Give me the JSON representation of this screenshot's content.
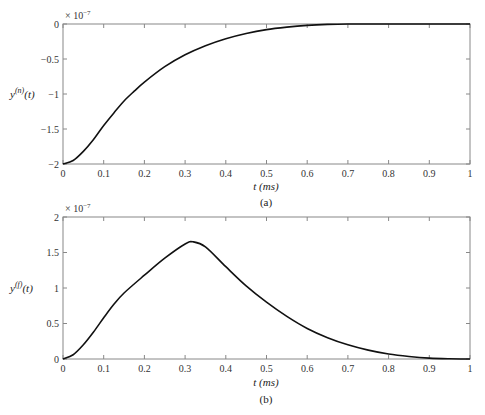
{
  "chart_data": [
    {
      "panel": "(a)",
      "type": "line",
      "title": "",
      "caption": "(a)",
      "xlabel": "t (ms)",
      "ylabel": "y(n)(t)",
      "ylabel_base": "y",
      "ylabel_sup": "(n)",
      "ylabel_arg": "(t)",
      "scale_label": "× 10",
      "scale_exp": "−7",
      "xlim": [
        0,
        1
      ],
      "ylim": [
        -2,
        0
      ],
      "xticks": [
        0,
        0.1,
        0.2,
        0.3,
        0.4,
        0.5,
        0.6,
        0.7,
        0.8,
        0.9,
        1
      ],
      "xtick_labels": [
        "0",
        "0.1",
        "0.2",
        "0.3",
        "0.4",
        "0.5",
        "0.6",
        "0.7",
        "0.8",
        "0.9",
        "1"
      ],
      "yticks": [
        -2,
        -1.5,
        -1,
        -0.5,
        0
      ],
      "ytick_labels": [
        "−2",
        "−1.5",
        "−1",
        "−0.5",
        "0"
      ],
      "grid": false,
      "x": [
        0,
        0.025,
        0.05,
        0.075,
        0.1,
        0.125,
        0.15,
        0.175,
        0.2,
        0.25,
        0.3,
        0.35,
        0.4,
        0.45,
        0.5,
        0.55,
        0.6,
        0.65,
        0.7,
        0.8,
        0.9,
        1.0
      ],
      "series": [
        {
          "name": "y(n)(t)",
          "color": "#111111",
          "values": [
            -2.0,
            -1.95,
            -1.82,
            -1.65,
            -1.45,
            -1.27,
            -1.1,
            -0.96,
            -0.83,
            -0.61,
            -0.44,
            -0.31,
            -0.21,
            -0.135,
            -0.08,
            -0.045,
            -0.02,
            -0.006,
            0.0,
            0.0,
            0.0,
            0.0
          ]
        }
      ]
    },
    {
      "panel": "(b)",
      "type": "line",
      "title": "",
      "caption": "(b)",
      "xlabel": "t (ms)",
      "ylabel": "y(f)(t)",
      "ylabel_base": "y",
      "ylabel_sup": "(f)",
      "ylabel_arg": "(t)",
      "scale_label": "× 10",
      "scale_exp": "−7",
      "xlim": [
        0,
        1
      ],
      "ylim": [
        0,
        2
      ],
      "xticks": [
        0,
        0.1,
        0.2,
        0.3,
        0.4,
        0.5,
        0.6,
        0.7,
        0.8,
        0.9,
        1
      ],
      "xtick_labels": [
        "0",
        "0.1",
        "0.2",
        "0.3",
        "0.4",
        "0.5",
        "0.6",
        "0.7",
        "0.8",
        "0.9",
        "1"
      ],
      "yticks": [
        0,
        0.5,
        1,
        1.5,
        2
      ],
      "ytick_labels": [
        "0",
        "0.5",
        "1",
        "1.5",
        "2"
      ],
      "grid": false,
      "x": [
        0,
        0.025,
        0.05,
        0.075,
        0.1,
        0.125,
        0.15,
        0.2,
        0.25,
        0.3,
        0.32,
        0.35,
        0.4,
        0.45,
        0.5,
        0.55,
        0.6,
        0.65,
        0.7,
        0.75,
        0.8,
        0.85,
        0.9,
        0.95,
        1.0
      ],
      "series": [
        {
          "name": "y(f)(t)",
          "color": "#111111",
          "values": [
            0.0,
            0.06,
            0.2,
            0.38,
            0.58,
            0.77,
            0.93,
            1.18,
            1.42,
            1.62,
            1.65,
            1.58,
            1.3,
            1.03,
            0.8,
            0.6,
            0.43,
            0.3,
            0.2,
            0.125,
            0.07,
            0.035,
            0.012,
            0.003,
            0.0
          ]
        }
      ]
    }
  ]
}
